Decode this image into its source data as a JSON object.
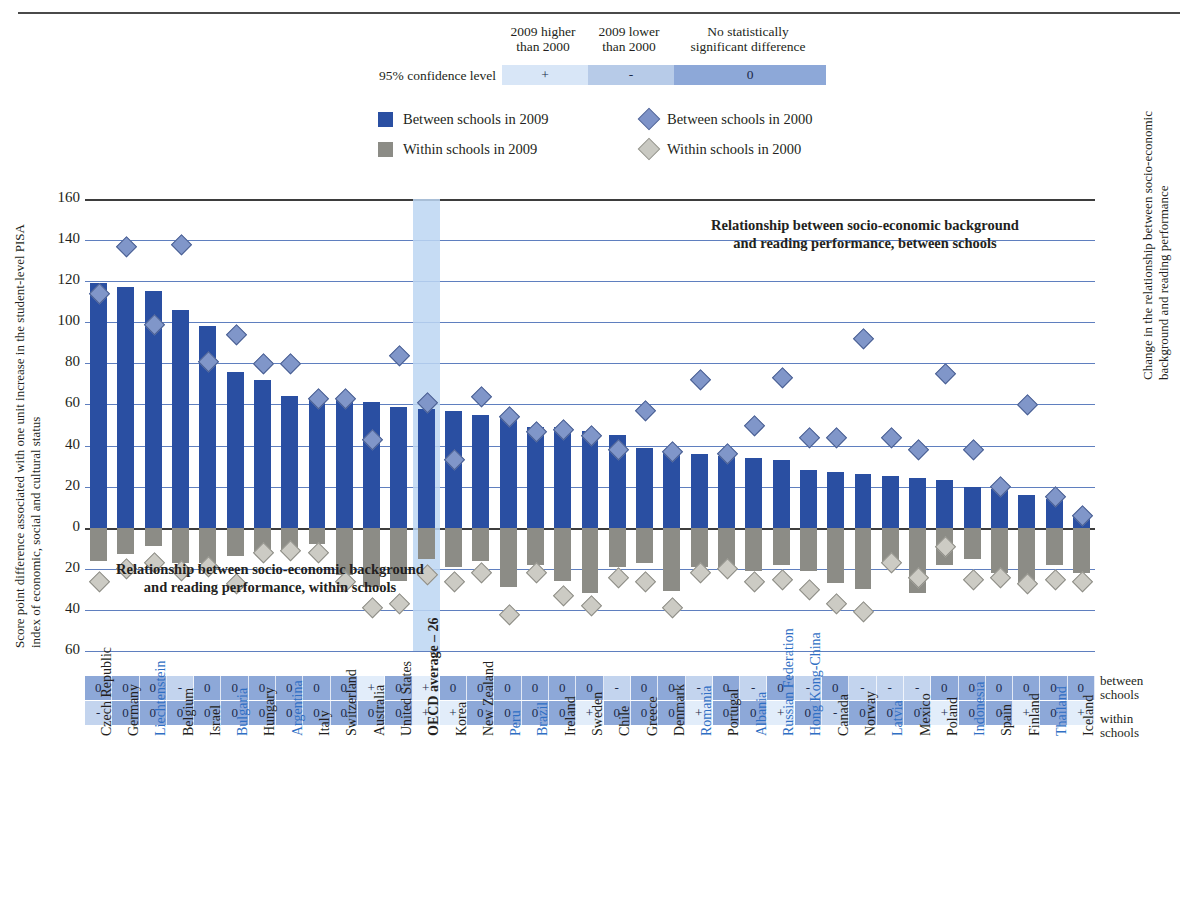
{
  "confidence_legend": {
    "row_label": "95% confidence level",
    "columns": [
      {
        "header": "2009 higher\nthan 2000",
        "symbol": "+",
        "color": "#d8e6f7"
      },
      {
        "header": "2009 lower\nthan 2000",
        "symbol": "-",
        "color": "#b7cbe8"
      },
      {
        "header": "No statistically\nsignificant difference",
        "symbol": "0",
        "color": "#8da8d8"
      }
    ]
  },
  "series_legend": [
    {
      "marker": "square-blue",
      "label": "Between schools in 2009",
      "color": "#2a4fa2"
    },
    {
      "marker": "diamond-blue",
      "label": "Between schools in 2000",
      "color": "#7e93c8"
    },
    {
      "marker": "square-grey",
      "label": "Within schools in 2009",
      "color": "#8c8c86"
    },
    {
      "marker": "diamond-grey",
      "label": "Within schools in 2000",
      "color": "#c9c9c2"
    }
  ],
  "axis": {
    "y_title": "Score point difference associated with one unit increase in the student-level PISA index of economic, social and cultural status",
    "right_title": "Change in the relationship between socio-economic background and reading performance",
    "ticks": [
      "160",
      "140",
      "120",
      "100",
      "80",
      "60",
      "40",
      "20",
      "0",
      "20",
      "40",
      "60"
    ]
  },
  "annotations": {
    "between": "Relationship between socio-economic background and reading performance, between schools",
    "within": "Relationship between socio-economic background and reading performance, within schools"
  },
  "sig_row_labels": {
    "between": "between\nschools",
    "within": "within\nschools"
  },
  "chart_data": {
    "type": "bar",
    "title": "",
    "xlabel": "",
    "ylabel": "Score point difference associated with one unit increase in the student-level PISA index of economic, social and cultural status",
    "ylim": [
      -60,
      160
    ],
    "grid": true,
    "legend_position": "top",
    "categories": [
      "Czech Republic",
      "Germany",
      "Liechtenstein",
      "Belgium",
      "Israel",
      "Bulgaria",
      "Hungary",
      "Argentina",
      "Italy",
      "Switzerland",
      "Australia",
      "United States",
      "OECD average – 26",
      "Korea",
      "New Zealand",
      "Peru",
      "Brazil",
      "Ireland",
      "Sweden",
      "Chile",
      "Greece",
      "Denmark",
      "Romania",
      "Portugal",
      "Albania",
      "Russian Federation",
      "Hong Kong-China",
      "Canada",
      "Norway",
      "Latvia",
      "Mexico",
      "Poland",
      "Indonesia",
      "Spain",
      "Finland",
      "Thailand",
      "Iceland"
    ],
    "highlight_blue_labels": [
      "Liechtenstein",
      "Bulgaria",
      "Argentina",
      "Peru",
      "Brazil",
      "Romania",
      "Albania",
      "Russian Federation",
      "Hong Kong-China",
      "Latvia",
      "Indonesia",
      "Thailand"
    ],
    "highlight_column": "OECD average – 26",
    "series": [
      {
        "name": "Between schools in 2009",
        "type": "bar",
        "values": [
          119,
          117,
          115,
          106,
          98,
          76,
          72,
          64,
          63,
          62,
          61,
          59,
          58,
          57,
          55,
          54,
          49,
          49,
          47,
          45,
          39,
          37,
          36,
          35,
          34,
          33,
          28,
          27,
          26,
          25,
          24,
          23,
          20,
          19,
          16,
          14,
          5
        ]
      },
      {
        "name": "Within schools in 2009",
        "type": "bar",
        "values": [
          -16,
          -13,
          -9,
          -17,
          -17,
          -14,
          -12,
          -11,
          -8,
          -23,
          -29,
          -26,
          -15,
          -19,
          -16,
          -29,
          -18,
          -26,
          -32,
          -19,
          -17,
          -31,
          -19,
          -20,
          -21,
          -18,
          -21,
          -27,
          -30,
          -17,
          -32,
          -18,
          -15,
          -22,
          -27,
          -18,
          -22
        ]
      },
      {
        "name": "Between schools in 2000",
        "type": "marker",
        "values": [
          114,
          137,
          99,
          138,
          81,
          94,
          80,
          80,
          63,
          63,
          43,
          84,
          61,
          33,
          64,
          54,
          47,
          48,
          45,
          38,
          57,
          37,
          72,
          36,
          50,
          73,
          44,
          44,
          92,
          44,
          38,
          75,
          38,
          20,
          60,
          15,
          6
        ]
      },
      {
        "name": "Within schools in 2000",
        "type": "marker",
        "values": [
          -26,
          -20,
          -17,
          -21,
          -19,
          -27,
          -12,
          -11,
          -12,
          -26,
          -39,
          -37,
          -23,
          -26,
          -22,
          -42,
          -22,
          -33,
          -38,
          -24,
          -26,
          -39,
          -22,
          -20,
          -26,
          -25,
          -30,
          -37,
          -41,
          -17,
          -24,
          -9,
          -25,
          -24,
          -27,
          -25,
          -26
        ]
      }
    ],
    "significance_between": [
      "0",
      "0",
      "0",
      "-",
      "0",
      "0",
      "0",
      "0",
      "0",
      "0",
      "+",
      "0",
      "+",
      "0",
      "0",
      "0",
      "0",
      "0",
      "0",
      "-",
      "0",
      "0",
      "-",
      "0",
      "-",
      "0",
      "-",
      "0",
      "-",
      "-",
      "-",
      "0",
      "0",
      "0",
      "0",
      "0",
      "0"
    ],
    "significance_within": [
      "-",
      "0",
      "0",
      "0",
      "0",
      "0",
      "0",
      "0",
      "0",
      "0",
      "0",
      "0",
      "+",
      "+",
      "0",
      "0",
      "0",
      "0",
      "+",
      "0",
      "0",
      "0",
      "+",
      "0",
      "0",
      "+",
      "0",
      "-",
      "0",
      "0",
      "0",
      "+",
      "0",
      "0",
      "+",
      "0",
      "+"
    ]
  }
}
